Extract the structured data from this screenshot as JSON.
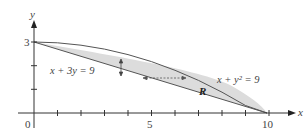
{
  "axes": {
    "x_label": "x",
    "y_label": "y",
    "x_ticks": [
      "0",
      "5",
      "10"
    ],
    "y_ticks": [
      "3"
    ]
  },
  "curves": {
    "line_label": "x + 3y = 9",
    "parabola_label": "x + y² = 9",
    "region_label": "R"
  },
  "colors": {
    "fill": "#dcdcdc",
    "stroke": "#555555",
    "axis": "#333333"
  }
}
